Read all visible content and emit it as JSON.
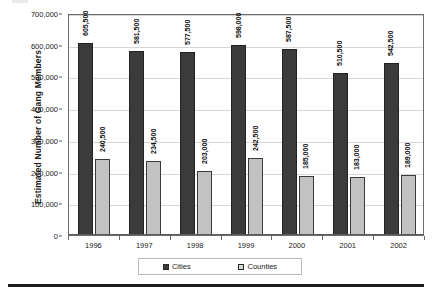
{
  "chart_data": {
    "type": "bar",
    "title": "",
    "xlabel": "",
    "ylabel": "Estimated Number of Gang Members",
    "categories": [
      "1996",
      "1997",
      "1998",
      "1999",
      "2000",
      "2001",
      "2002"
    ],
    "series": [
      {
        "name": "Cities",
        "color": "#3b3b3b",
        "values": [
          605500,
          581500,
          577500,
          598000,
          587500,
          510500,
          542500
        ],
        "labels": [
          "605,500",
          "581,500",
          "577,500",
          "598,000",
          "587,500",
          "510,500",
          "542,500"
        ]
      },
      {
        "name": "Counties",
        "color": "#c2c2c2",
        "values": [
          240500,
          234500,
          203000,
          242500,
          185000,
          183000,
          189000
        ],
        "labels": [
          "240,500",
          "234,500",
          "203,000",
          "242,500",
          "185,000",
          "183,000",
          "189,000"
        ]
      }
    ],
    "ylim": [
      0,
      700000
    ],
    "ytick_values": [
      0,
      100000,
      200000,
      300000,
      400000,
      500000,
      600000,
      700000
    ],
    "ytick_labels": [
      "0",
      "100,000",
      "200,000",
      "300,000",
      "400,000",
      "500,000",
      "600,000",
      "700,000"
    ],
    "grid": true,
    "legend_position": "bottom"
  },
  "legend": {
    "items": [
      {
        "label": "Cities"
      },
      {
        "label": "Counties"
      }
    ]
  },
  "axis": {
    "y_title": "Estimated Number of Gang Members"
  }
}
